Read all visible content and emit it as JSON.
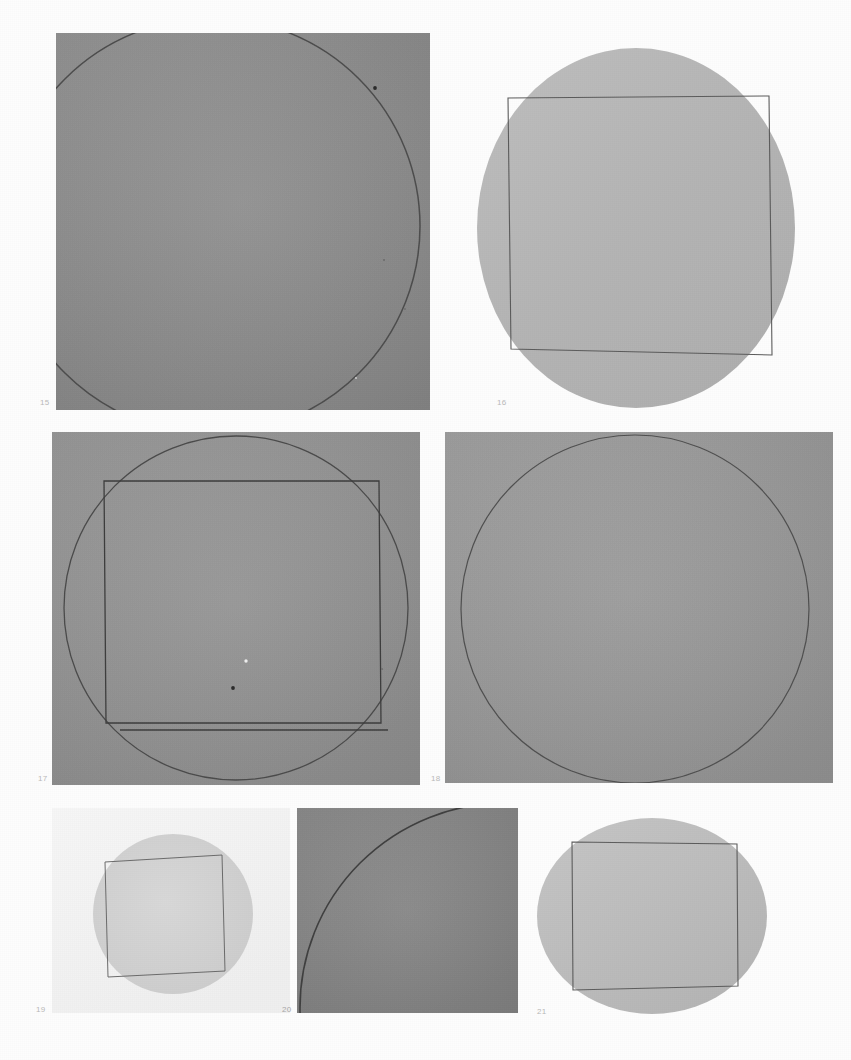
{
  "plate": {
    "background_color": "#fdfdfd",
    "width": 851,
    "height": 1060,
    "medium": "halftone photographic plate",
    "figure_count": 7
  },
  "figures": [
    {
      "number": "15",
      "caption": "15",
      "kind": "square-plate-with-circle-arc",
      "frame": {
        "x": 56,
        "y": 33,
        "w": 374,
        "h": 377,
        "shape": "rectangle",
        "fill": "#8f8f8f"
      },
      "caption_pos": {
        "x": 40,
        "y": 399
      },
      "caption_color": "#b5b5b5",
      "shapes": [
        {
          "type": "circle-arc",
          "cx": 212,
          "cy": 226,
          "r": 208,
          "stroke": "#4c4c4c",
          "stroke_width": 1.4
        },
        {
          "type": "speck",
          "cx": 375,
          "cy": 88,
          "r": 1.8,
          "fill": "#2b2b2b"
        },
        {
          "type": "speck",
          "cx": 384,
          "cy": 260,
          "r": 0.9,
          "fill": "#6a6a6a"
        },
        {
          "type": "speck",
          "cx": 405,
          "cy": 309,
          "r": 0.9,
          "fill": "#6f6f6f"
        }
      ]
    },
    {
      "number": "16",
      "caption": "16",
      "kind": "circle-plate-with-inscribed-square",
      "frame": {
        "x": 477,
        "y": 48,
        "w": 318,
        "h": 360,
        "shape": "ellipse",
        "fill": "#b4b4b4"
      },
      "caption_pos": {
        "x": 497,
        "y": 399
      },
      "caption_color": "#c3c3c3",
      "shapes": [
        {
          "type": "ellipse",
          "cx": 636,
          "cy": 228,
          "rx": 159,
          "ry": 180,
          "fill": "#b4b4b4"
        },
        {
          "type": "quadrilateral",
          "points": "508,98 769,96 772,355 511,349",
          "stroke": "#5b5b5b",
          "stroke_width": 1.1
        }
      ]
    },
    {
      "number": "17",
      "caption": "17",
      "kind": "square-plate-with-circle-and-inscribed-square",
      "frame": {
        "x": 52,
        "y": 432,
        "w": 368,
        "h": 353,
        "shape": "rectangle",
        "fill": "#949494"
      },
      "caption_pos": {
        "x": 38,
        "y": 775
      },
      "caption_color": "#b5b5b5",
      "shapes": [
        {
          "type": "circle",
          "cx": 236,
          "cy": 608,
          "r": 172,
          "stroke": "#4a4a4a",
          "stroke_width": 1.3
        },
        {
          "type": "quadrilateral",
          "points": "104,481 379,481 381,723 106,723",
          "stroke": "#3d3d3d",
          "stroke_width": 1.3
        },
        {
          "type": "line",
          "x1": 120,
          "y1": 730,
          "x2": 388,
          "y2": 730,
          "stroke": "#3d3d3d",
          "stroke_width": 1.3
        },
        {
          "type": "speck",
          "cx": 233,
          "cy": 688,
          "r": 1.8,
          "fill": "#2b2b2b"
        },
        {
          "type": "speck",
          "cx": 246,
          "cy": 661,
          "r": 1.6,
          "fill": "#efefef"
        }
      ]
    },
    {
      "number": "18",
      "caption": "18",
      "kind": "square-plate-with-large-circle",
      "frame": {
        "x": 445,
        "y": 432,
        "w": 388,
        "h": 351,
        "shape": "rectangle",
        "fill": "#9a9a9a"
      },
      "caption_pos": {
        "x": 431,
        "y": 775
      },
      "caption_color": "#b5b5b5",
      "shapes": [
        {
          "type": "circle",
          "cx": 635,
          "cy": 609,
          "r": 174,
          "stroke": "#4f4f4f",
          "stroke_width": 1.2
        }
      ]
    },
    {
      "number": "19",
      "caption": "19",
      "kind": "light-plate-with-circle-and-inscribed-square",
      "frame": {
        "x": 52,
        "y": 808,
        "w": 238,
        "h": 205,
        "shape": "rectangle",
        "fill": "#f2f2f2"
      },
      "caption_pos": {
        "x": 36,
        "y": 1006
      },
      "caption_color": "#c6c6c6",
      "shapes": [
        {
          "type": "circle",
          "cx": 173,
          "cy": 914,
          "r": 80,
          "fill": "#d3d3d3"
        },
        {
          "type": "quadrilateral",
          "points": "105,862 222,855 225,971 108,977",
          "stroke": "#6b6b6b",
          "stroke_width": 1.0
        }
      ]
    },
    {
      "number": "20",
      "caption": "20",
      "kind": "square-plate-with-corner-arc",
      "frame": {
        "x": 297,
        "y": 808,
        "w": 221,
        "h": 205,
        "shape": "rectangle",
        "fill": "#868686"
      },
      "caption_pos": {
        "x": 282,
        "y": 1006
      },
      "caption_color": "#a8a8a8",
      "shapes": [
        {
          "type": "circle-arc",
          "cx": 505,
          "cy": 1008,
          "r": 205,
          "stroke": "#3f3f3f",
          "stroke_width": 1.5
        }
      ]
    },
    {
      "number": "21",
      "caption": "21",
      "kind": "circle-plate-with-inscribed-square",
      "frame": {
        "x": 537,
        "y": 818,
        "w": 231,
        "h": 197,
        "shape": "ellipse",
        "fill": "#bcbcbc"
      },
      "caption_pos": {
        "x": 537,
        "y": 1008
      },
      "caption_color": "#c6c6c6",
      "shapes": [
        {
          "type": "ellipse",
          "cx": 652,
          "cy": 916,
          "rx": 115,
          "ry": 98,
          "fill": "#bcbcbc"
        },
        {
          "type": "quadrilateral",
          "points": "572,842 737,844 738,986 573,990",
          "stroke": "#5c5c5c",
          "stroke_width": 1.1
        }
      ]
    }
  ],
  "colors": {
    "paper": "#fdfdfd",
    "dark_gray_plate": "#868686",
    "mid_gray_plate": "#949494",
    "light_gray_plate": "#b4b4b4",
    "very_light_plate": "#f2f2f2",
    "ink_line": "#4a4a4a",
    "caption_text": "#b9b9b9"
  }
}
